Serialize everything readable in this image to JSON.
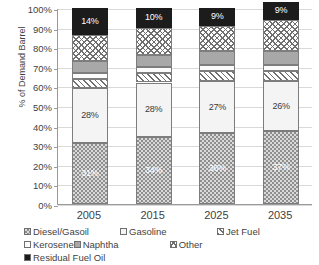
{
  "chart_data": {
    "type": "bar",
    "stacked": true,
    "title": "",
    "xlabel": "",
    "ylabel": "% of Demand Barrel",
    "ylim": [
      0,
      100
    ],
    "ytick_labels": [
      "100%",
      "90%",
      "80%",
      "70%",
      "60%",
      "50%",
      "40%",
      "30%",
      "20%",
      "10%",
      "0%"
    ],
    "ytick_values": [
      100,
      90,
      80,
      70,
      60,
      50,
      40,
      30,
      20,
      10,
      0
    ],
    "grid": true,
    "legend_position": "bottom",
    "categories": [
      "2005",
      "2015",
      "2025",
      "2035"
    ],
    "series": [
      {
        "name": "Diesel/Gasoil",
        "pattern": "dotted-dark-gray",
        "values": [
          31,
          34,
          36,
          37
        ],
        "labels": [
          "31%",
          "34%",
          "36%",
          "37%"
        ],
        "label_color": "light"
      },
      {
        "name": "Gasoline",
        "pattern": "solid-white",
        "values": [
          28,
          28,
          27,
          26
        ],
        "labels": [
          "28%",
          "28%",
          "27%",
          "26%"
        ],
        "label_color": "dark"
      },
      {
        "name": "Jet Fuel",
        "pattern": "diagonal-hatch",
        "values": [
          5,
          5,
          5,
          5
        ],
        "labels": [
          "",
          "",
          "",
          ""
        ],
        "label_color": "dark"
      },
      {
        "name": "Kerosene",
        "pattern": "solid-light",
        "values": [
          3,
          3,
          3,
          3
        ],
        "labels": [
          "",
          "",
          "",
          ""
        ],
        "label_color": "dark"
      },
      {
        "name": "Naphtha",
        "pattern": "solid-gray",
        "values": [
          6,
          6,
          7,
          7
        ],
        "labels": [
          "",
          "",
          "",
          ""
        ],
        "label_color": "dark"
      },
      {
        "name": "Other",
        "pattern": "cross-hatch",
        "values": [
          13,
          14,
          13,
          16
        ],
        "labels": [
          "",
          "",
          "",
          ""
        ],
        "label_color": "dark"
      },
      {
        "name": "Residual Fuel Oil",
        "pattern": "solid-black",
        "values": [
          14,
          10,
          9,
          9
        ],
        "labels": [
          "14%",
          "10%",
          "9%",
          "9%"
        ],
        "label_color": "light"
      }
    ],
    "legend": [
      "Diesel/Gasoil",
      "Gasoline",
      "Jet Fuel",
      "Kerosene",
      "Naphtha",
      "Other",
      "Residual Fuel Oil"
    ],
    "colors": {
      "diesel": "#8e8e8e",
      "gasoline": "#f4f4f4",
      "jetfuel": "#ffffff",
      "kerosene": "#fbfbfb",
      "naphtha": "#a8a8a8",
      "other": "#ffffff",
      "residual": "#1c1c1c",
      "axis": "#9a9a9a",
      "grid": "#d9d9d9",
      "text": "#3f3f3f"
    }
  }
}
